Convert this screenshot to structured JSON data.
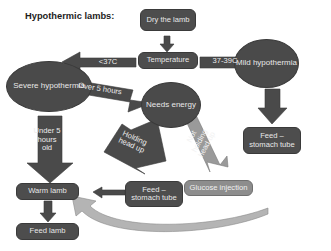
{
  "diagram": {
    "title": "Hypothermic lambs:",
    "colors": {
      "node_dark": "#4d4d4d",
      "node_light": "#8d8d8d",
      "arrow_dark": "#4a4a4a",
      "arrow_light": "#9a9a9a",
      "text_light": "#e8e8e8",
      "title_text": "#1d1d22",
      "background": "#ffffff"
    },
    "nodes": [
      {
        "id": "dry_the_lamb",
        "label": "Dry the lamb",
        "shape": "box"
      },
      {
        "id": "temperature",
        "label": "Temperature",
        "shape": "box"
      },
      {
        "id": "severe_hypothermia",
        "label": "Severe hypothermia",
        "shape": "ellipse"
      },
      {
        "id": "mild_hypothermia",
        "label": "Mild hypothermia",
        "shape": "ellipse"
      },
      {
        "id": "needs_energy",
        "label": "Needs energy",
        "shape": "ellipse"
      },
      {
        "id": "feed_stomach_tube_right",
        "label": "Feed – stomach tube",
        "shape": "box"
      },
      {
        "id": "feed_stomach_tube_mid",
        "label": "Feed – stomach tube",
        "shape": "box"
      },
      {
        "id": "glucose_injection",
        "label": "Glucose injection",
        "shape": "box-light"
      },
      {
        "id": "warm_lamb",
        "label": "Warm lamb",
        "shape": "box"
      },
      {
        "id": "feed_lamb",
        "label": "Feed lamb",
        "shape": "box"
      }
    ],
    "arrow_labels": [
      {
        "id": "below_37c",
        "label": "<37C"
      },
      {
        "id": "range_37_39c",
        "label": "37-39C"
      },
      {
        "id": "over_5_hours",
        "label": "Over 5 hours"
      },
      {
        "id": "under_5_hours_old",
        "label": "Under 5 hours old"
      },
      {
        "id": "holding_head_up",
        "label": "Holding head up"
      },
      {
        "id": "not_holding_head_up",
        "label": "Not holding head up"
      }
    ]
  }
}
